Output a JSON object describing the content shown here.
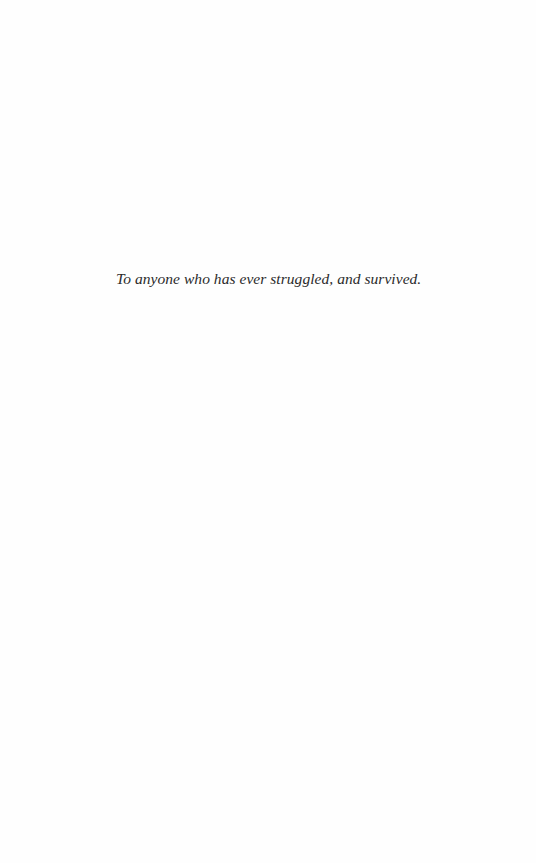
{
  "page": {
    "type": "dedication",
    "background_color": "#fefefe",
    "text_color": "#2b2b2b"
  },
  "dedication": {
    "text": "To anyone who has ever struggled, and survived."
  }
}
